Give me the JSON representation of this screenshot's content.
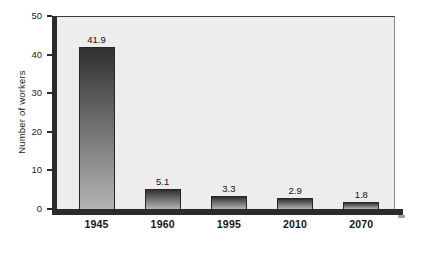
{
  "chart_data": {
    "type": "bar",
    "categories": [
      "1945",
      "1960",
      "1995",
      "2010",
      "2070"
    ],
    "values": [
      41.9,
      5.1,
      3.3,
      2.9,
      1.8
    ],
    "value_labels": [
      "41.9",
      "5.1",
      "3.3",
      "2.9",
      "1.8"
    ],
    "title": "",
    "xlabel": "",
    "ylabel": "Number of workers",
    "ylim": [
      0,
      50
    ],
    "yticks": [
      0,
      10,
      20,
      30,
      40,
      50
    ],
    "ytick_labels": [
      "0",
      "10",
      "20",
      "30",
      "40",
      "50"
    ],
    "grid": false,
    "legend": null,
    "colors": {
      "plot_bg": "#ededed",
      "axis": "#2b2b2b",
      "bar_top": "#303030",
      "bar_bottom": "#b4b4b4",
      "bar_border": "#262626",
      "plot_top_border": "#3b3b3b",
      "plot_right_border": "#8c8c8c"
    }
  }
}
